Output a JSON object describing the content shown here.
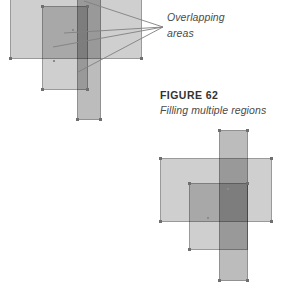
{
  "figure": {
    "number_label": "FIGURE 62",
    "title": "Filling multiple regions"
  },
  "callout": {
    "label_line1": "Overlapping",
    "label_line2": "areas",
    "leader_line_count": 4,
    "converge_point": {
      "x": 163,
      "y": 27
    }
  },
  "colors": {
    "page_background": "#ffffff",
    "fill_light": "#d3d3d3",
    "fill_medium": "#b5b5b5",
    "fill_dark": "#5a5a5a",
    "outline": "#6e6e6e",
    "handle": "#6f6f6f",
    "text_caption": "#333333",
    "text_italic": "#4a4a4a",
    "leader_line": "#808080"
  },
  "diagrams": [
    {
      "name": "top-diagram",
      "description": "Partially cropped arrangement of three overlapping filled regions with callout leader lines",
      "shapes": [
        {
          "name": "wide-rectangle",
          "x": 10,
          "y": -14,
          "width": 132,
          "height": 87,
          "tone": "light"
        },
        {
          "name": "vertical-strip",
          "x": 77,
          "y": -14,
          "width": 24,
          "height": 148,
          "tone": "strip"
        },
        {
          "name": "square",
          "x": 42,
          "y": 20,
          "width": 46,
          "height": 84,
          "tone": "light"
        }
      ]
    },
    {
      "name": "bottom-diagram",
      "description": "Complete arrangement of three overlapping filled regions",
      "shapes": [
        {
          "name": "wide-rectangle",
          "x": 15,
          "y": 33,
          "width": 112,
          "height": 64,
          "tone": "light"
        },
        {
          "name": "vertical-strip",
          "x": 74,
          "y": 5,
          "width": 29,
          "height": 151,
          "tone": "strip"
        },
        {
          "name": "square",
          "x": 44,
          "y": 58,
          "width": 59,
          "height": 67,
          "tone": "light"
        }
      ]
    }
  ]
}
